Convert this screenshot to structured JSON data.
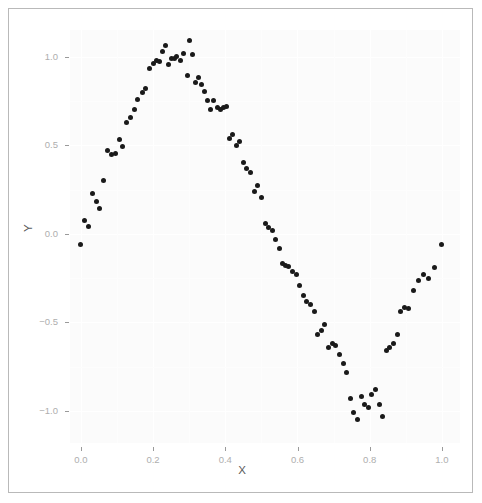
{
  "chart_data": {
    "type": "scatter",
    "title": "",
    "subtitle": "",
    "xlabel": "X",
    "ylabel": "Y",
    "xlim": [
      -0.03,
      1.05
    ],
    "ylim": [
      -1.18,
      1.15
    ],
    "xticks": [
      "0.0",
      "0.2",
      "0.4",
      "0.6",
      "0.8",
      "1.0"
    ],
    "xtick_values": [
      0.0,
      0.2,
      0.4,
      0.6,
      0.8,
      1.0
    ],
    "yticks": [
      "1.0",
      "0.5",
      "0.0",
      "-0.5",
      "-1.0"
    ],
    "ytick_values": [
      1.0,
      0.5,
      0.0,
      -0.5,
      -1.0
    ],
    "grid": true,
    "grid_color": "#ffffff",
    "panel_background": "#fbfbfb",
    "legend": null,
    "legend_position": "none",
    "point_color": "#1a1a1a",
    "point_size": 5,
    "n_points": 101,
    "series": [
      {
        "name": "observations",
        "x": [
          0.0,
          0.01,
          0.02,
          0.032,
          0.042,
          0.053,
          0.063,
          0.074,
          0.085,
          0.095,
          0.106,
          0.116,
          0.127,
          0.138,
          0.148,
          0.158,
          0.17,
          0.18,
          0.19,
          0.2,
          0.21,
          0.218,
          0.226,
          0.234,
          0.242,
          0.25,
          0.258,
          0.266,
          0.276,
          0.285,
          0.294,
          0.3,
          0.31,
          0.318,
          0.326,
          0.334,
          0.342,
          0.35,
          0.36,
          0.368,
          0.378,
          0.386,
          0.394,
          0.402,
          0.412,
          0.42,
          0.43,
          0.44,
          0.45,
          0.46,
          0.47,
          0.48,
          0.49,
          0.5,
          0.51,
          0.52,
          0.53,
          0.54,
          0.55,
          0.558,
          0.568,
          0.576,
          0.586,
          0.596,
          0.606,
          0.616,
          0.626,
          0.636,
          0.646,
          0.656,
          0.666,
          0.676,
          0.686,
          0.696,
          0.706,
          0.716,
          0.726,
          0.736,
          0.746,
          0.756,
          0.766,
          0.776,
          0.786,
          0.796,
          0.806,
          0.816,
          0.826,
          0.836,
          0.846,
          0.856,
          0.866,
          0.876,
          0.886,
          0.896,
          0.906,
          0.92,
          0.935,
          0.95,
          0.962,
          0.98,
          1.0
        ],
        "y": [
          -0.06,
          0.075,
          0.04,
          0.23,
          0.18,
          0.145,
          0.3,
          0.47,
          0.45,
          0.455,
          0.53,
          0.49,
          0.63,
          0.655,
          0.7,
          0.76,
          0.8,
          0.82,
          0.935,
          0.96,
          0.98,
          0.97,
          1.03,
          1.06,
          0.955,
          0.99,
          0.99,
          1.0,
          0.98,
          1.02,
          0.895,
          1.09,
          1.01,
          0.855,
          0.88,
          0.84,
          0.805,
          0.75,
          0.7,
          0.755,
          0.715,
          0.7,
          0.71,
          0.72,
          0.54,
          0.56,
          0.5,
          0.52,
          0.4,
          0.37,
          0.345,
          0.24,
          0.27,
          0.205,
          0.06,
          0.035,
          0.02,
          -0.03,
          -0.085,
          -0.17,
          -0.18,
          -0.185,
          -0.215,
          -0.23,
          -0.29,
          -0.35,
          -0.38,
          -0.4,
          -0.44,
          -0.57,
          -0.545,
          -0.51,
          -0.64,
          -0.62,
          -0.63,
          -0.68,
          -0.73,
          -0.78,
          -0.93,
          -1.01,
          -1.05,
          -0.915,
          -0.96,
          -0.98,
          -0.905,
          -0.88,
          -0.96,
          -1.03,
          -0.66,
          -0.64,
          -0.62,
          -0.57,
          -0.44,
          -0.415,
          -0.42,
          -0.32,
          -0.265,
          -0.23,
          -0.25,
          -0.19,
          -0.06
        ]
      }
    ]
  }
}
